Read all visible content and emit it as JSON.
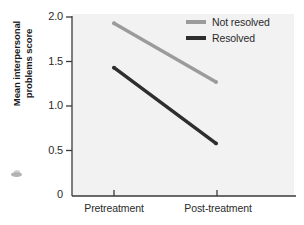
{
  "chart_data": {
    "type": "line",
    "title": "",
    "xlabel": "",
    "ylabel": "Mean interpersonal problems score",
    "ylabel_line1": "Mean interpersonal",
    "ylabel_line2": "problems score",
    "categories": [
      "Pretreatment",
      "Post-treatment"
    ],
    "ylim": [
      0,
      2.0
    ],
    "yticks": [
      "0",
      "0.5",
      "1.0",
      "1.5",
      "2.0"
    ],
    "ytick_values": [
      0,
      0.5,
      1.0,
      1.5,
      2.0
    ],
    "grid": false,
    "legend_position": "top-right",
    "series": [
      {
        "name": "Not resolved",
        "values": [
          1.93,
          1.27
        ],
        "color": "#9b9b9b"
      },
      {
        "name": "Resolved",
        "values": [
          1.43,
          0.58
        ],
        "color": "#2e2e2e"
      }
    ]
  },
  "legend": {
    "items": [
      {
        "label": "Not resolved",
        "color": "#9b9b9b"
      },
      {
        "label": "Resolved",
        "color": "#2e2e2e"
      }
    ]
  },
  "axes": {
    "y": {
      "label_line1": "Mean interpersonal",
      "label_line2": "problems score",
      "ticks": [
        "2.0",
        "1.5",
        "1.0",
        "0.5",
        "0"
      ]
    },
    "x": {
      "ticks": [
        "Pretreatment",
        "Post-treatment"
      ]
    }
  },
  "colors": {
    "plot_background": "#f2f2f2",
    "axis": "#3a3a3a",
    "text": "#2b2b2b",
    "series_not_resolved": "#9b9b9b",
    "series_resolved": "#2e2e2e"
  }
}
